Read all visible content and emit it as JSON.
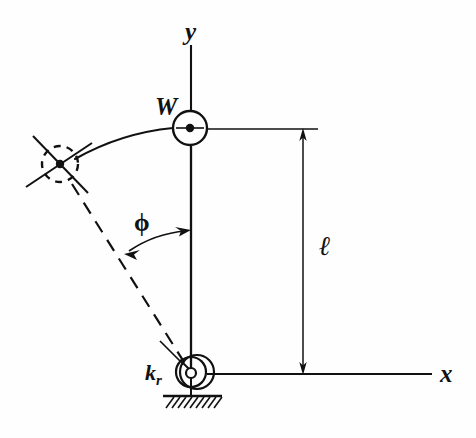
{
  "figure": {
    "background_color": "#fefefe",
    "stroke_color": "#111111",
    "width": 476,
    "height": 438
  },
  "labels": {
    "y_axis": "y",
    "x_axis": "x",
    "weight": "W",
    "length": "ℓ",
    "angle": "ϕ",
    "spring_constant_base": "k",
    "spring_constant_sub": "r"
  },
  "geometry": {
    "pivot": {
      "x": 191,
      "y": 372
    },
    "mass_center": {
      "x": 190,
      "y": 128
    },
    "displaced_mass_center": {
      "x": 60,
      "y": 165
    },
    "mass_radius": 17,
    "displaced_mass_radius": 18,
    "rod_length_px": 244,
    "y_axis_top": {
      "x": 191,
      "y": 45
    },
    "x_axis_right": {
      "x": 432,
      "y": 374
    },
    "dimension_line_x": 303,
    "dimension_top_y": 129,
    "dimension_bottom_y": 374,
    "extension_line_top_end": 318,
    "ground_left": 163,
    "ground_right": 222,
    "ground_y": 396
  },
  "elements": {
    "y_axis_line": "vertical-axis",
    "x_axis_line": "horizontal-axis",
    "pendulum_rod": "rigid-rod",
    "mass_bob": "concentrated-weight",
    "displaced_bob": "displaced-position-dashed",
    "swing_arc": "trajectory-arc",
    "angle_arc": "angle-phi-arc",
    "torsional_spring": "rotational-spring-spiral",
    "ground_hatch": "fixed-support-hatching",
    "dimension_line": "length-dimension"
  }
}
